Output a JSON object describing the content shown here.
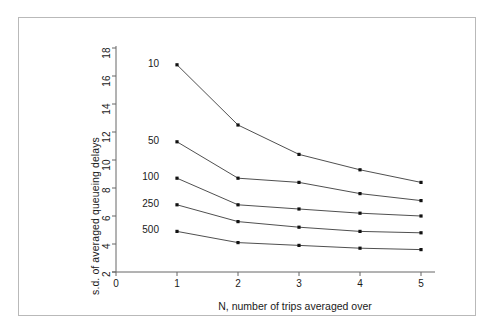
{
  "figure": {
    "background_color": "#ffffff",
    "border_color": "#b9b9b9",
    "line_color": "#3b3b3b",
    "marker_color": "#111111",
    "axis_color": "#666666"
  },
  "chart_data": {
    "type": "line",
    "title": "",
    "subtitle": "",
    "xlabel": "N, number of trips averaged over",
    "ylabel": "s.d. of averaged queueing delays",
    "x": [
      1,
      2,
      3,
      4,
      5
    ],
    "xlim": [
      0,
      5
    ],
    "ylim": [
      2,
      18
    ],
    "xticks": [
      "0",
      "1",
      "2",
      "3",
      "4",
      "5"
    ],
    "xtick_values": [
      0,
      1,
      2,
      3,
      4,
      5
    ],
    "yticks": [
      "2",
      "4",
      "6",
      "8",
      "10",
      "12",
      "14",
      "16",
      "18"
    ],
    "ytick_values": [
      2,
      4,
      6,
      8,
      10,
      12,
      14,
      16,
      18
    ],
    "grid": false,
    "legend_position": "inline-left-of-first-point",
    "marker": "square-dot",
    "series": [
      {
        "name": "10",
        "label": "10",
        "values": [
          16.8,
          12.5,
          10.4,
          9.3,
          8.4
        ]
      },
      {
        "name": "50",
        "label": "50",
        "values": [
          11.3,
          8.7,
          8.4,
          7.6,
          7.1
        ]
      },
      {
        "name": "100",
        "label": "100",
        "values": [
          8.7,
          6.8,
          6.5,
          6.2,
          6.0
        ]
      },
      {
        "name": "250",
        "label": "250",
        "values": [
          6.8,
          5.6,
          5.2,
          4.9,
          4.8
        ]
      },
      {
        "name": "500",
        "label": "500",
        "values": [
          4.9,
          4.1,
          3.9,
          3.7,
          3.6
        ]
      }
    ]
  },
  "annotations": {
    "series_label_note": "Series labelled by offered load level, drawn to the left of the N=1 point"
  }
}
